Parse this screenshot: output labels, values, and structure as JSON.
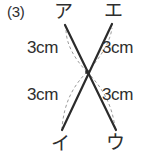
{
  "problem": {
    "number": "(3)",
    "figure_type": "two-intersecting-segments"
  },
  "figure": {
    "center": {
      "x": 87,
      "y": 72
    },
    "vertices": [
      {
        "id": "a",
        "label": "ア",
        "position": "top-left",
        "x": 64,
        "y": 24
      },
      {
        "id": "e",
        "label": "エ",
        "position": "top-right",
        "x": 113,
        "y": 22
      },
      {
        "id": "i",
        "label": "イ",
        "position": "bottom-left",
        "x": 60,
        "y": 133
      },
      {
        "id": "u",
        "label": "ウ",
        "position": "bottom-right",
        "x": 117,
        "y": 133
      }
    ],
    "segments": [
      {
        "id": "a-u",
        "from": "a",
        "to": "u",
        "style": "solid",
        "color": "#2b2b2b"
      },
      {
        "id": "e-i",
        "from": "e",
        "to": "i",
        "style": "solid",
        "color": "#2b2b2b"
      }
    ],
    "arcs": [
      {
        "id": "arc-a",
        "along": "center-to-a",
        "style": "dashed",
        "color": "#9a9a9a"
      },
      {
        "id": "arc-e",
        "along": "center-to-e",
        "style": "dashed",
        "color": "#9a9a9a"
      },
      {
        "id": "arc-i",
        "along": "center-to-i",
        "style": "dashed",
        "color": "#9a9a9a"
      },
      {
        "id": "arc-u",
        "along": "center-to-u",
        "style": "dashed",
        "color": "#9a9a9a"
      }
    ],
    "measures": [
      {
        "id": "tl",
        "text": "3cm",
        "quadrant": "top-left",
        "refers_to": "center-to-a"
      },
      {
        "id": "tr",
        "text": "3cm",
        "quadrant": "top-right",
        "refers_to": "center-to-e"
      },
      {
        "id": "bl",
        "text": "3cm",
        "quadrant": "bottom-left",
        "refers_to": "center-to-i"
      },
      {
        "id": "br",
        "text": "3cm",
        "quadrant": "bottom-right",
        "refers_to": "center-to-u"
      }
    ]
  },
  "colors": {
    "ink": "#2b2b2b",
    "dashed": "#9a9a9a",
    "background": "#ffffff"
  }
}
